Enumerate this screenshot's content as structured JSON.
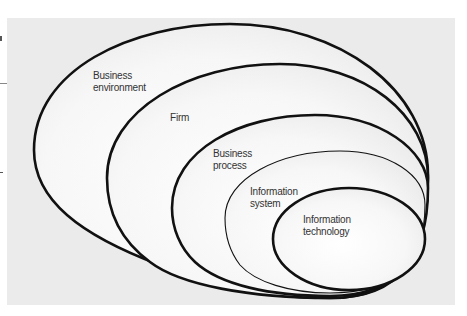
{
  "diagram": {
    "type": "nested-ellipses",
    "colors": {
      "panel_background": "#ebebeb",
      "ellipse_fill_center": "#ffffff",
      "stroke": "#111111",
      "label_text": "#333333"
    },
    "layers": [
      {
        "id": "business-environment",
        "line1": "Business",
        "line2": "environment",
        "stroke_weight": "thick"
      },
      {
        "id": "firm",
        "line1": "Firm",
        "line2": "",
        "stroke_weight": "thick"
      },
      {
        "id": "business-process",
        "line1": "Business",
        "line2": "process",
        "stroke_weight": "thick"
      },
      {
        "id": "information-system",
        "line1": "Information",
        "line2": "system",
        "stroke_weight": "thin"
      },
      {
        "id": "information-technology",
        "line1": "Information",
        "line2": "technology",
        "stroke_weight": "thick"
      }
    ]
  }
}
